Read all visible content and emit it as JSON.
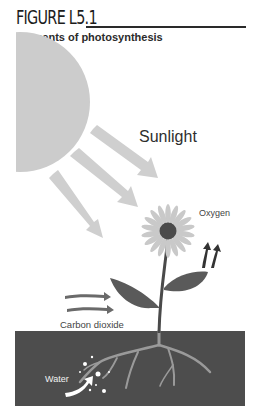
{
  "figure": {
    "number": "FIGURE L5.1",
    "title": "Elements of photosynthesis"
  },
  "labels": {
    "sunlight": "Sunlight",
    "oxygen": "Oxygen",
    "carbon_dioxide": "Carbon dioxide",
    "water": "Water"
  },
  "elements": [
    {
      "name": "sun",
      "shape": "circle",
      "color": "#cccccc"
    },
    {
      "name": "sunlight-arrows",
      "count": 3,
      "color": "#cfcfcf"
    },
    {
      "name": "flower",
      "petal_color": "#c9c9c9",
      "center_color": "#4a4a4a"
    },
    {
      "name": "oxygen-arrows",
      "count": 2,
      "color": "#333333"
    },
    {
      "name": "carbon-dioxide-arrows",
      "count": 2,
      "color": "#6a6a6a"
    },
    {
      "name": "leaves",
      "count": 2,
      "color": "#5a5a5a"
    },
    {
      "name": "soil",
      "color": "#4d4d4d"
    },
    {
      "name": "roots",
      "color": "#9a9a9a"
    },
    {
      "name": "water-arrow",
      "color": "#ffffff"
    }
  ]
}
